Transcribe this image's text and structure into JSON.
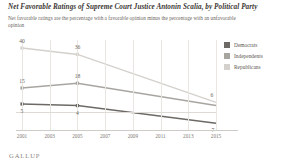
{
  "chart_data": {
    "type": "line",
    "title": "Net Favorable Ratings of Supreme Court Justice Antonin Scalia, by Political Party",
    "subtitle": "Net favorable ratings are the percentage with a favorable opinion minus the percentage with an unfavorable opinion",
    "xlabel": "",
    "ylabel": "",
    "x": [
      2001,
      2003,
      2005,
      2007,
      2009,
      2011,
      2013,
      2015
    ],
    "tick_labels": [
      "2001",
      "2003",
      "2005",
      "2007",
      "2009",
      "2011",
      "2013",
      "2015"
    ],
    "xlim": [
      2001,
      2015
    ],
    "ylim": [
      -10,
      45
    ],
    "grid": "vertical",
    "zero_line": true,
    "legend_position": "right",
    "series": [
      {
        "name": "Democrats",
        "color": "#6d6a66",
        "x": [
          2001,
          2005,
          2015
        ],
        "values": [
          5,
          4,
          -7
        ],
        "labels": [
          {
            "x": 2001,
            "value": 5,
            "text": "5"
          },
          {
            "x": 2005,
            "value": 4,
            "text": "4"
          },
          {
            "x": 2015,
            "value": -7,
            "text": "-7"
          }
        ]
      },
      {
        "name": "Independents",
        "color": "#a8a5a1",
        "x": [
          2001,
          2005,
          2015
        ],
        "values": [
          15,
          18,
          4
        ],
        "labels": [
          {
            "x": 2001,
            "value": 15,
            "text": "15"
          },
          {
            "x": 2005,
            "value": 18,
            "text": "18"
          }
        ]
      },
      {
        "name": "Republicans",
        "color": "#d4d1cd",
        "x": [
          2001,
          2005,
          2015
        ],
        "values": [
          40,
          36,
          6
        ],
        "labels": [
          {
            "x": 2001,
            "value": 40,
            "text": "40"
          },
          {
            "x": 2005,
            "value": 36,
            "text": "36"
          },
          {
            "x": 2015,
            "value": 6,
            "text": "6"
          }
        ]
      }
    ]
  },
  "footer": {
    "brand": "GALLUP"
  }
}
